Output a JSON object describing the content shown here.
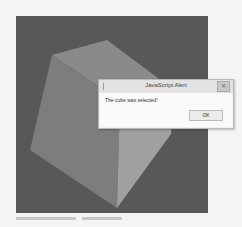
{
  "scene": {
    "background_color": "#585858",
    "cube_faces": [
      {
        "name": "top-face",
        "color": "#8a8a8a"
      },
      {
        "name": "front-face",
        "color": "#7d7d7d"
      },
      {
        "name": "right-face",
        "color": "#a0a0a0"
      }
    ]
  },
  "alert": {
    "title": "JavaScript Alert",
    "message": "The cube was selected!",
    "ok_label": "OK",
    "close_glyph": "✕"
  }
}
